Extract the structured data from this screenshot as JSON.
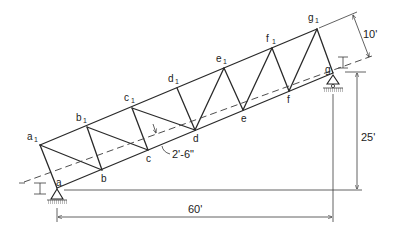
{
  "diagram": {
    "type": "inclined-truss",
    "top_chord_nodes": [
      {
        "id": "a1",
        "letter": "a",
        "sub": "1",
        "x": 40,
        "y": 145
      },
      {
        "id": "b1",
        "letter": "b",
        "sub": "1",
        "x": 87,
        "y": 127
      },
      {
        "id": "c1",
        "letter": "c",
        "sub": "1",
        "x": 132,
        "y": 108
      },
      {
        "id": "d1",
        "letter": "d",
        "sub": "1",
        "x": 177,
        "y": 88
      },
      {
        "id": "e1",
        "letter": "e",
        "sub": "1",
        "x": 224,
        "y": 68
      },
      {
        "id": "f1",
        "letter": "f",
        "sub": "1",
        "x": 272,
        "y": 48
      },
      {
        "id": "g1",
        "letter": "g",
        "sub": "1",
        "x": 317,
        "y": 29
      }
    ],
    "bottom_chord_nodes": [
      {
        "id": "a",
        "letter": "a",
        "x": 57,
        "y": 188
      },
      {
        "id": "b",
        "letter": "b",
        "x": 102,
        "y": 170
      },
      {
        "id": "c",
        "letter": "c",
        "x": 148,
        "y": 150
      },
      {
        "id": "d",
        "letter": "d",
        "x": 195,
        "y": 130
      },
      {
        "id": "e",
        "letter": "e",
        "x": 243,
        "y": 110
      },
      {
        "id": "f",
        "letter": "f",
        "x": 289,
        "y": 91
      },
      {
        "id": "g",
        "letter": "g",
        "x": 333,
        "y": 73
      }
    ],
    "dimensions": {
      "horizontal_span": "60'",
      "vertical_rise": "25'",
      "truss_depth": "10'",
      "centerline_offset": "2'-6\""
    },
    "supports": [
      {
        "node": "a",
        "type": "pin"
      },
      {
        "node": "g",
        "type": "roller"
      }
    ]
  }
}
